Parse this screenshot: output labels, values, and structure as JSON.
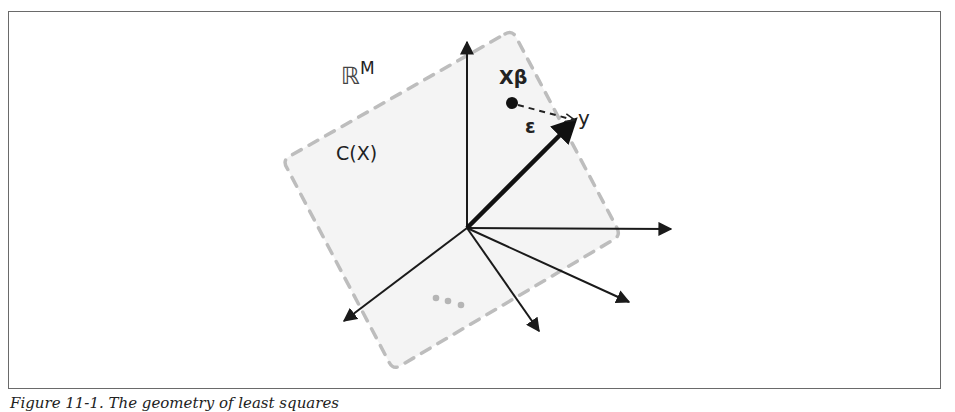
{
  "figure": {
    "caption": "Figure 11-1. The geometry of least squares",
    "labels": {
      "space": "ℝ",
      "space_superscript": "M",
      "column_space": "C(X)",
      "projection": "Xβ",
      "residual": "ε",
      "target": "y"
    },
    "colors": {
      "arrow": "#1a1a1a",
      "plane_fill": "#f4f4f4",
      "plane_border": "#bdbdbd",
      "dots": "#b5b5b5",
      "frame": "#6a6a6a"
    },
    "geometry": {
      "origin": [
        467,
        228
      ],
      "plane_corners": [
        [
          510,
          32
        ],
        [
          620,
          235
        ],
        [
          393,
          368
        ],
        [
          283,
          160
        ]
      ],
      "basis_arrow_tips": [
        [
          467,
          40
        ],
        [
          672,
          229
        ],
        [
          630,
          302
        ],
        [
          540,
          332
        ],
        [
          343,
          322
        ]
      ],
      "y_arrow_tip": [
        575,
        120
      ],
      "projection_point": [
        512,
        103
      ],
      "ellipsis_dots": [
        [
          436,
          298
        ],
        [
          448,
          301
        ],
        [
          461,
          305
        ]
      ]
    }
  }
}
